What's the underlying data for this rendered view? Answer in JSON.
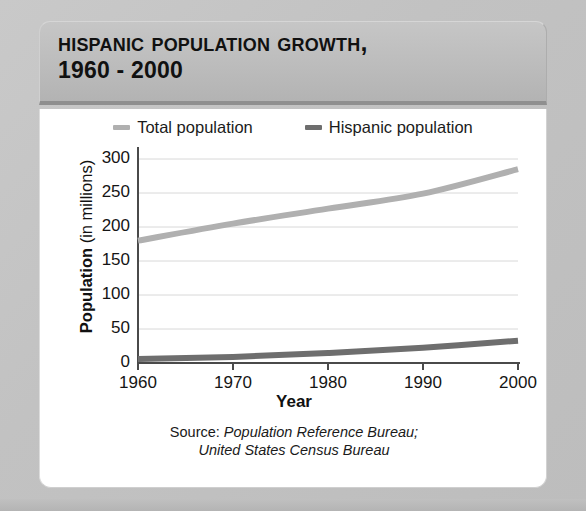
{
  "title": {
    "line1": "Hispanic Population Growth,",
    "line2": "1960 - 2000"
  },
  "source": {
    "prefix": "Source:",
    "line1": "Population Reference Bureau;",
    "line2": "United States Census Bureau"
  },
  "colors": {
    "total_line": "#b0b0b0",
    "hispanic_line": "#6e6e6e",
    "gridline": "#d8d8d8",
    "axis": "#4a4a4a",
    "panel_background": "#ffffff",
    "header_background": "#bdbdbd",
    "outer_background": "#c4c4c4",
    "text": "#111111"
  },
  "chart_data": {
    "type": "line",
    "title": "Hispanic Population Growth, 1960 - 2000",
    "xlabel": "Year",
    "ylabel": "Population (in millions)",
    "xlim": [
      1960,
      2000
    ],
    "ylim": [
      0,
      300
    ],
    "xticks": [
      1960,
      1970,
      1980,
      1990,
      2000
    ],
    "yticks": [
      0,
      50,
      100,
      150,
      200,
      250,
      300
    ],
    "grid": true,
    "grid_axis": "y",
    "legend_position": "top-center",
    "x": [
      1960,
      1970,
      1980,
      1990,
      2000
    ],
    "series": [
      {
        "name": "Total population",
        "color": "#b0b0b0",
        "values": [
          180,
          205,
          227,
          249,
          285
        ]
      },
      {
        "name": "Hispanic population",
        "color": "#6e6e6e",
        "values": [
          6,
          9,
          14.6,
          22.4,
          32.8
        ]
      }
    ]
  }
}
